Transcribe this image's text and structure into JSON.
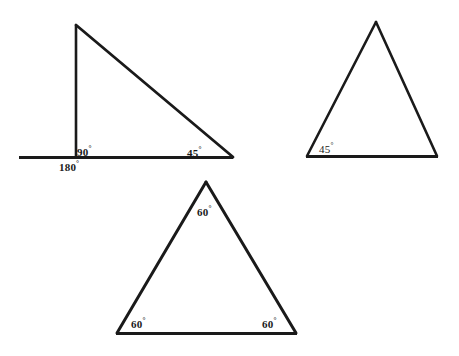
{
  "figure": {
    "type": "geometry-diagram",
    "background_color": "#ffffff",
    "stroke_color": "#1a1a1a",
    "text_color": "#1a1a1a",
    "degree_symbol": "°",
    "shapes": [
      {
        "id": "right-triangle",
        "name": "right triangle with extended base",
        "kind": "triangle",
        "vertices": [
          [
            75,
            25
          ],
          [
            75,
            157
          ],
          [
            232,
            157
          ]
        ],
        "extended_ray": [
          [
            19,
            157
          ],
          [
            75,
            157
          ]
        ],
        "angles": [
          {
            "label": "90",
            "value": 90,
            "at_vertex": [
              75,
              157
            ]
          },
          {
            "label": "45",
            "value": 45,
            "at_vertex": [
              232,
              157
            ]
          },
          {
            "label": "180",
            "value": 180,
            "at_vertex": [
              75,
              157
            ]
          }
        ]
      },
      {
        "id": "isosceles-triangle",
        "name": "isosceles triangle",
        "kind": "triangle",
        "vertices": [
          [
            376,
            22
          ],
          [
            307,
            156
          ],
          [
            437,
            156
          ]
        ],
        "angles": [
          {
            "label": "45",
            "value": 45,
            "at_vertex": [
              307,
              156
            ]
          }
        ]
      },
      {
        "id": "equilateral-triangle",
        "name": "equilateral triangle",
        "kind": "triangle",
        "vertices": [
          [
            206,
            182
          ],
          [
            117,
            333
          ],
          [
            296,
            333
          ]
        ],
        "angles": [
          {
            "label": "60",
            "value": 60,
            "at_vertex": [
              206,
              182
            ]
          },
          {
            "label": "60",
            "value": 60,
            "at_vertex": [
              117,
              333
            ]
          },
          {
            "label": "60",
            "value": 60,
            "at_vertex": [
              296,
              333
            ]
          }
        ]
      }
    ]
  },
  "labels": {
    "triangle1_right_angle": "90",
    "triangle1_straight_angle": "180",
    "triangle1_base_angle": "45",
    "triangle2_base_angle": "45",
    "triangle3_apex_angle": "60",
    "triangle3_left_angle": "60",
    "triangle3_right_angle": "60",
    "degree": "°"
  }
}
